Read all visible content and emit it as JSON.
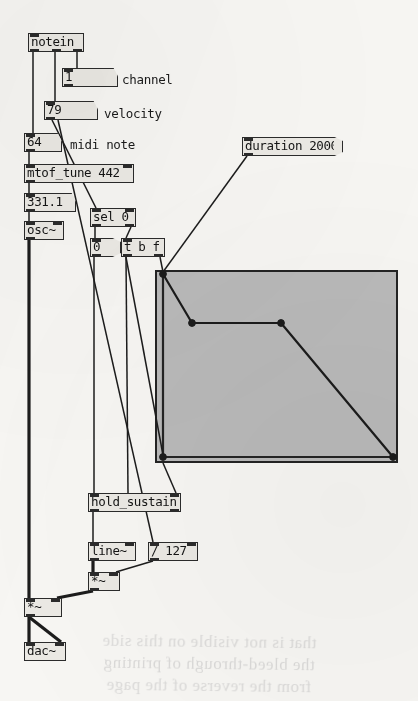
{
  "patch": {
    "title": "Pure Data patch",
    "canvas": {
      "width": 418,
      "height": 701,
      "background": "#f7f6f3"
    }
  },
  "objects": {
    "notein": {
      "label": "notein",
      "x": 28,
      "y": 33,
      "w": 56,
      "h": 19
    },
    "channel_num": {
      "label": "1",
      "x": 62,
      "y": 68,
      "w": 46,
      "h": 19
    },
    "velocity_num": {
      "label": "79",
      "x": 44,
      "y": 101,
      "w": 44,
      "h": 19
    },
    "midinote_num": {
      "label": "64",
      "x": 24,
      "y": 133,
      "w": 28,
      "h": 19
    },
    "mtof_tune": {
      "label": "mtof_tune 442",
      "x": 24,
      "y": 164,
      "w": 110,
      "h": 19
    },
    "freq_num": {
      "label": "331.1",
      "x": 24,
      "y": 193,
      "w": 42,
      "h": 19
    },
    "osc": {
      "label": "osc~",
      "x": 24,
      "y": 221,
      "w": 40,
      "h": 19
    },
    "sel0": {
      "label": "sel 0",
      "x": 90,
      "y": 208,
      "w": 46,
      "h": 19
    },
    "zero_msg": {
      "label": "0",
      "x": 90,
      "y": 238,
      "w": 22,
      "h": 19
    },
    "trigger": {
      "label": "t b f",
      "x": 121,
      "y": 238,
      "w": 44,
      "h": 19
    },
    "duration_msg": {
      "label": "duration 2000",
      "x": 242,
      "y": 137,
      "w": 92,
      "h": 19
    },
    "hold_sustain": {
      "label": "hold_sustain",
      "x": 88,
      "y": 493,
      "w": 93,
      "h": 19
    },
    "line": {
      "label": "line~",
      "x": 88,
      "y": 542,
      "w": 48,
      "h": 19
    },
    "div127": {
      "label": "/ 127",
      "x": 148,
      "y": 542,
      "w": 50,
      "h": 19
    },
    "times_right": {
      "label": "*~",
      "x": 88,
      "y": 572,
      "w": 32,
      "h": 19
    },
    "times_left": {
      "label": "*~",
      "x": 24,
      "y": 598,
      "w": 38,
      "h": 19
    },
    "dac": {
      "label": "dac~",
      "x": 24,
      "y": 642,
      "w": 42,
      "h": 19
    }
  },
  "comments": {
    "channel": {
      "label": "channel",
      "x": 122,
      "y": 72
    },
    "velocity": {
      "label": "velocity",
      "x": 104,
      "y": 106
    },
    "midi_note": {
      "label": "midi note",
      "x": 70,
      "y": 137
    }
  },
  "graph": {
    "name": "envelope-array",
    "x": 155,
    "y": 270,
    "w": 243,
    "h": 193,
    "background": "#b9b9b9",
    "border_color": "#232323"
  },
  "chart_data": {
    "type": "line",
    "xlabel": "",
    "ylabel": "",
    "xlim": [
      0,
      243
    ],
    "ylim": [
      0,
      193
    ],
    "grid": false,
    "legend": false,
    "series": [
      {
        "name": "envelope",
        "points": [
          {
            "x": 8,
            "y": 191,
            "stage": "attack-peak"
          },
          {
            "x": 37,
            "y": 138,
            "stage": "decay-end"
          },
          {
            "x": 126,
            "y": 138,
            "stage": "sustain-end"
          },
          {
            "x": 238,
            "y": 4,
            "stage": "release-end"
          },
          {
            "x": 8,
            "y": 4,
            "stage": "origin"
          }
        ]
      }
    ]
  },
  "ghost_text": {
    "line1": "that is not visible on this side",
    "line2": "the bleed-through of printing",
    "line3": "from the reverse of the page"
  }
}
